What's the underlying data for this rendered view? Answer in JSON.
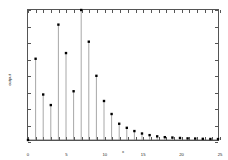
{
  "chart_data": {
    "type": "line",
    "render_style": "stem",
    "title": "",
    "subtitle": "",
    "xlabel": "x",
    "ylabel": "output",
    "xlim": [
      0,
      25
    ],
    "ylim": [
      0,
      1.6
    ],
    "grid": false,
    "legend": null,
    "marker": "filled-square",
    "marker_color": "#000000",
    "stem_color": "#808080",
    "baseline_color": "#555555",
    "x": [
      0,
      1,
      2,
      3,
      4,
      5,
      6,
      7,
      8,
      9,
      10,
      11,
      12,
      13,
      14,
      15,
      16,
      17,
      18,
      19,
      20,
      21,
      22,
      23,
      24,
      25
    ],
    "values": [
      0.0,
      1.0,
      0.56,
      0.43,
      1.42,
      1.07,
      0.6,
      1.6,
      1.21,
      0.79,
      0.48,
      0.32,
      0.2,
      0.15,
      0.11,
      0.08,
      0.06,
      0.045,
      0.035,
      0.03,
      0.025,
      0.02,
      0.018,
      0.015,
      0.013,
      0.012
    ],
    "xticks": [
      0,
      5,
      10,
      15,
      20,
      25
    ],
    "xtick_labels": [
      "0",
      "5",
      "10",
      "15",
      "20",
      "25"
    ],
    "yticks": [
      0,
      0.2,
      0.4,
      0.6,
      0.8,
      1,
      1.2,
      1.4,
      1.6
    ],
    "ytick_labels": [
      "0",
      "0.2",
      "0.4",
      "0.6",
      "0.8",
      "1",
      "1.2",
      "1.4",
      "1.6"
    ]
  }
}
